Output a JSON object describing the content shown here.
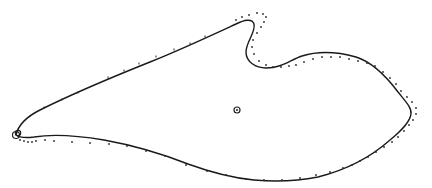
{
  "diagram": {
    "colors": {
      "background": "#ffffff",
      "line": "#1a1a1a",
      "dots": "#2a2a2a"
    },
    "solid_contour": {
      "style": "solid",
      "path": "M 16 135 C 18 126, 26 117, 40 110 C 70 95, 110 78, 150 62 C 180 50, 210 36, 236 24 C 244 20, 252 18, 254 24 C 256 32, 246 42, 246 52 C 246 62, 256 68, 266 68 C 282 68, 290 60, 302 56 C 318 51, 338 52, 356 57 C 372 62, 386 76, 398 92 C 406 102, 412 108, 411 114 C 410 122, 402 130, 390 140 C 372 156, 346 170, 318 177 C 298 181, 276 182, 254 180 C 232 178, 210 172, 188 164 C 160 153, 132 145, 104 140 C 80 136, 52 134, 34 137 C 26 138, 20 138, 16 135 Z"
    },
    "dotted_contour": {
      "style": "dotted",
      "points": [
        [
          20,
          140
        ],
        [
          24,
          141
        ],
        [
          28,
          142
        ],
        [
          32,
          142
        ],
        [
          36,
          141
        ],
        [
          45,
          140
        ],
        [
          54,
          141
        ],
        [
          72,
          142
        ],
        [
          90,
          143
        ],
        [
          109,
          144
        ],
        [
          127,
          146
        ],
        [
          146,
          151
        ],
        [
          165,
          156
        ],
        [
          186,
          165
        ],
        [
          207,
          171
        ],
        [
          226,
          175
        ],
        [
          246,
          179
        ],
        [
          264,
          180
        ],
        [
          282,
          180
        ],
        [
          300,
          178
        ],
        [
          316,
          175
        ],
        [
          330,
          172
        ],
        [
          343,
          168
        ],
        [
          352,
          165
        ],
        [
          360,
          161
        ],
        [
          368,
          157
        ],
        [
          376,
          152
        ],
        [
          384,
          147
        ],
        [
          392,
          142
        ],
        [
          398,
          137
        ],
        [
          404,
          131
        ],
        [
          409,
          125
        ],
        [
          413,
          120
        ],
        [
          416,
          114
        ],
        [
          416,
          108
        ],
        [
          412,
          102
        ],
        [
          407,
          97
        ],
        [
          401,
          91
        ],
        [
          396,
          84
        ],
        [
          390,
          78
        ],
        [
          383,
          72
        ],
        [
          375,
          66
        ],
        [
          367,
          63
        ],
        [
          358,
          61
        ],
        [
          349,
          59
        ],
        [
          340,
          57
        ],
        [
          331,
          57
        ],
        [
          322,
          57
        ],
        [
          313,
          59
        ],
        [
          304,
          62
        ],
        [
          296,
          65
        ],
        [
          289,
          66
        ],
        [
          281,
          67
        ],
        [
          273,
          67
        ],
        [
          266,
          65
        ],
        [
          259,
          61
        ],
        [
          254,
          54
        ],
        [
          252,
          47
        ],
        [
          253,
          40
        ],
        [
          257,
          33
        ],
        [
          261,
          27
        ],
        [
          264,
          22
        ],
        [
          266,
          17
        ],
        [
          263,
          14
        ],
        [
          257,
          13
        ],
        [
          249,
          15
        ],
        [
          242,
          17
        ],
        [
          236,
          20
        ]
      ]
    },
    "tick_marks": [
      [
        44,
        108
      ],
      [
        62,
        100
      ],
      [
        78,
        93
      ],
      [
        108,
        78
      ],
      [
        124,
        71
      ],
      [
        139,
        64
      ],
      [
        156,
        57
      ],
      [
        174,
        50
      ],
      [
        190,
        44
      ],
      [
        205,
        37
      ]
    ],
    "markers": {
      "leading_edge_circle": {
        "cx": 16,
        "cy": 135,
        "r": 3.5,
        "label": ""
      },
      "center_circle": {
        "cx": 237,
        "cy": 110,
        "r": 3,
        "label": ""
      }
    }
  }
}
